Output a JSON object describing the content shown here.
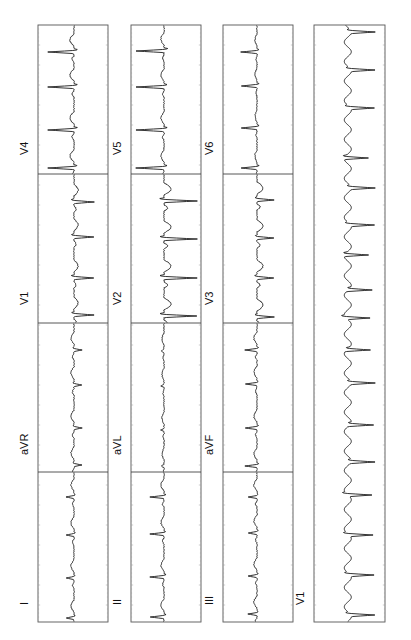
{
  "chart_data": {
    "type": "line",
    "orientation": "rotated-counterclockwise",
    "grid": false,
    "tick_marks": true,
    "layout": {
      "rows": [
        {
          "name": "row-1",
          "frame": {
            "x0": 38,
            "x1": 108
          },
          "baseline_x": 74,
          "segments": [
            {
              "lead": "I",
              "y0": 622,
              "y1": 472,
              "label_y": 605,
              "beats": [
                618,
                578,
                535,
                497
              ],
              "qrs_dir": "left",
              "qrs_amp": 8,
              "wave_amp": 3,
              "style": "small"
            },
            {
              "lead": "aVR",
              "y0": 472,
              "y1": 323,
              "label_y": 455,
              "beats": [
                465,
                428,
                385,
                350
              ],
              "qrs_dir": "right",
              "qrs_amp": 8,
              "wave_amp": 3,
              "style": "small"
            },
            {
              "lead": "V1",
              "y0": 323,
              "y1": 174,
              "label_y": 305,
              "beats": [
                315,
                278,
                237,
                202
              ],
              "qrs_dir": "right",
              "qrs_amp": 20,
              "wave_amp": 4,
              "style": "deep"
            },
            {
              "lead": "V4",
              "y0": 174,
              "y1": 25,
              "label_y": 155,
              "beats": [
                168,
                130,
                87,
                52
              ],
              "qrs_dir": "left",
              "qrs_amp": 26,
              "wave_amp": 4,
              "style": "tall"
            }
          ]
        },
        {
          "name": "row-2",
          "frame": {
            "x0": 131,
            "x1": 201
          },
          "baseline_x": 164,
          "segments": [
            {
              "lead": "II",
              "y0": 622,
              "y1": 472,
              "label_y": 605,
              "beats": [
                617,
                577,
                534,
                497
              ],
              "qrs_dir": "left",
              "qrs_amp": 14,
              "wave_amp": 3,
              "style": "small"
            },
            {
              "lead": "aVL",
              "y0": 472,
              "y1": 323,
              "label_y": 455,
              "beats": [
                466,
                430,
                386,
                351
              ],
              "qrs_dir": "left",
              "qrs_amp": 3,
              "wave_amp": 2,
              "style": "flat"
            },
            {
              "lead": "V2",
              "y0": 323,
              "y1": 174,
              "label_y": 305,
              "beats": [
                316,
                278,
                239,
                201
              ],
              "qrs_dir": "right",
              "qrs_amp": 33,
              "wave_amp": 7,
              "style": "deep"
            },
            {
              "lead": "V5",
              "y0": 174,
              "y1": 25,
              "label_y": 155,
              "beats": [
                168,
                130,
                87,
                51
              ],
              "qrs_dir": "left",
              "qrs_amp": 28,
              "wave_amp": 3,
              "style": "tall"
            }
          ]
        },
        {
          "name": "row-3",
          "frame": {
            "x0": 223,
            "x1": 293
          },
          "baseline_x": 257,
          "segments": [
            {
              "lead": "III",
              "y0": 622,
              "y1": 472,
              "label_y": 605,
              "beats": [
                614,
                576,
                533,
                497
              ],
              "qrs_dir": "left",
              "qrs_amp": 9,
              "wave_amp": 3,
              "style": "small"
            },
            {
              "lead": "aVF",
              "y0": 472,
              "y1": 323,
              "label_y": 455,
              "beats": [
                466,
                428,
                384,
                350
              ],
              "qrs_dir": "left",
              "qrs_amp": 12,
              "wave_amp": 3,
              "style": "small"
            },
            {
              "lead": "V3",
              "y0": 323,
              "y1": 174,
              "label_y": 305,
              "beats": [
                317,
                278,
                238,
                200
              ],
              "qrs_dir": "right",
              "qrs_amp": 17,
              "wave_amp": 6,
              "style": "deep"
            },
            {
              "lead": "V6",
              "y0": 174,
              "y1": 25,
              "label_y": 155,
              "beats": [
                168,
                128,
                86,
                52
              ],
              "qrs_dir": "left",
              "qrs_amp": 16,
              "wave_amp": 2,
              "style": "tall"
            }
          ]
        },
        {
          "name": "rhythm-strip",
          "frame": {
            "x0": 314,
            "x1": 385
          },
          "baseline_x": 352,
          "segments": [
            {
              "lead": "V1",
              "y0": 622,
              "y1": 25,
              "label_y": 605,
              "beats": [
                615,
                575,
                535,
                495,
                462,
                425,
                383,
                350,
                318,
                290,
                255,
                225,
                188,
                158,
                108,
                70,
                32
              ],
              "qrs_dir": "right",
              "qrs_amp": 24,
              "wave_amp": 7,
              "style": "flutter"
            }
          ]
        }
      ],
      "label_x_offset": -10
    },
    "leads": [
      "I",
      "aVR",
      "V1",
      "V4",
      "II",
      "aVL",
      "V2",
      "V5",
      "III",
      "aVF",
      "V3",
      "V6",
      "V1"
    ],
    "xlabel": "",
    "ylabel": ""
  },
  "labels": {
    "row1": [
      "I",
      "aVR",
      "V1",
      "V4"
    ],
    "row2": [
      "II",
      "aVL",
      "V2",
      "V5"
    ],
    "row3": [
      "III",
      "aVF",
      "V3",
      "V6"
    ],
    "rhythm": "V1"
  },
  "colors": {
    "trace": "#1a1a1a",
    "frame": "#555555",
    "background": "#ffffff"
  }
}
